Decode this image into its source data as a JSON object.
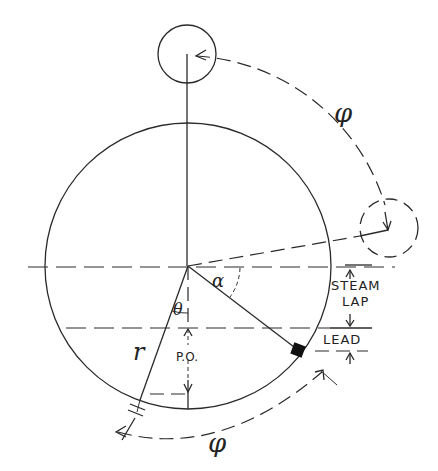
{
  "diagram": {
    "labels": {
      "phi_top": "φ",
      "phi_bottom": "φ",
      "alpha": "α",
      "theta": "θ",
      "radius": "r",
      "steam": "STEAM",
      "lap": "LAP",
      "lead": "LEAD",
      "po": "P.O."
    },
    "colors": {
      "stroke": "#2a2a2a",
      "background": "#ffffff"
    }
  }
}
